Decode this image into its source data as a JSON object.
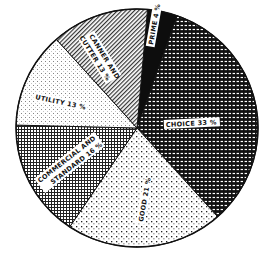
{
  "chart_data": {
    "type": "pie",
    "title": "",
    "categories": [
      "Prime",
      "Choice",
      "Good",
      "Commercial and Standard",
      "Utility",
      "Canner and Cutter"
    ],
    "values": [
      4,
      33,
      21,
      16,
      13,
      13
    ],
    "unit": "%",
    "labels": [
      "PRIME 4 %",
      "CHOICE 33 %",
      "GOOD 21 %",
      "COMMERCIAL AND STANDARD 16 %",
      "UTILITY 13 %",
      "CANNER AND CUTTER 13 %"
    ],
    "start_angle_deg": 5,
    "direction": "clockwise",
    "fills": [
      "solid-black",
      "black-with-white-dashes",
      "white-with-dark-dots",
      "crosshatch",
      "light-dots",
      "diagonal-lines"
    ],
    "legend": "none"
  },
  "labels": {
    "prime": "PRIME 4 %",
    "choice": "CHOICE 33 %",
    "good": "GOOD 21 %",
    "commercial_line1": "COMMERCIAL AND",
    "commercial_line2": "STANDARD 16 %",
    "utility": "UTILITY 13 %",
    "canner_line1": "CANNER AND",
    "canner_line2": "CUTTER 13 %"
  }
}
